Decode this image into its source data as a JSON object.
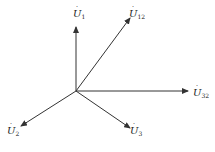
{
  "diagram": {
    "type": "phasor-diagram",
    "origin": {
      "x": 76,
      "y": 91
    },
    "line_color": "#333333",
    "vectors": [
      {
        "id": "U1",
        "base": "U",
        "sub": "1",
        "end": {
          "x": 76,
          "y": 27
        },
        "label_pos": {
          "x": 73,
          "y": 9
        }
      },
      {
        "id": "U12",
        "base": "U",
        "sub": "12",
        "end": {
          "x": 130,
          "y": 18
        },
        "label_pos": {
          "x": 129,
          "y": 9
        }
      },
      {
        "id": "U32",
        "base": "U",
        "sub": "32",
        "end": {
          "x": 188,
          "y": 91
        },
        "label_pos": {
          "x": 193,
          "y": 88
        }
      },
      {
        "id": "U2",
        "base": "U",
        "sub": "2",
        "end": {
          "x": 21,
          "y": 126
        },
        "label_pos": {
          "x": 7,
          "y": 126
        }
      },
      {
        "id": "U3",
        "base": "U",
        "sub": "3",
        "end": {
          "x": 130,
          "y": 128
        },
        "label_pos": {
          "x": 130,
          "y": 126
        }
      }
    ]
  }
}
